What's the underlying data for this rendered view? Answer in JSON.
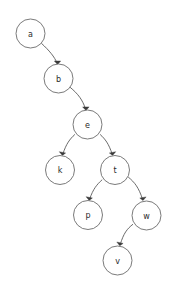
{
  "diagram": {
    "type": "node-link-tree",
    "background_color": "#ffffff",
    "node_fill_color": "#ffffff",
    "node_stroke_color": "#6b6b6b",
    "edge_color": "#5a5a5a",
    "label_color": "#2b2b2b",
    "node_radius": 14.5,
    "nodes": [
      {
        "id": "a",
        "label": "a",
        "cx": 30.5,
        "cy": 33.5
      },
      {
        "id": "b",
        "label": "b",
        "cx": 58.5,
        "cy": 78.5
      },
      {
        "id": "e",
        "label": "e",
        "cx": 87.5,
        "cy": 124.5
      },
      {
        "id": "k",
        "label": "k",
        "cx": 60.0,
        "cy": 170.0
      },
      {
        "id": "t",
        "label": "t",
        "cx": 115.0,
        "cy": 170.0
      },
      {
        "id": "p",
        "label": "p",
        "cx": 88.0,
        "cy": 215.0
      },
      {
        "id": "w",
        "label": "w",
        "cx": 146.5,
        "cy": 215.5
      },
      {
        "id": "v",
        "label": "v",
        "cx": 117.5,
        "cy": 260.5
      }
    ],
    "edges": [
      {
        "from": "a",
        "to": "b",
        "directed": true
      },
      {
        "from": "b",
        "to": "e",
        "directed": true
      },
      {
        "from": "e",
        "to": "k",
        "directed": true
      },
      {
        "from": "e",
        "to": "t",
        "directed": true
      },
      {
        "from": "t",
        "to": "p",
        "directed": true
      },
      {
        "from": "t",
        "to": "w",
        "directed": true
      },
      {
        "from": "w",
        "to": "v",
        "directed": true
      }
    ]
  }
}
